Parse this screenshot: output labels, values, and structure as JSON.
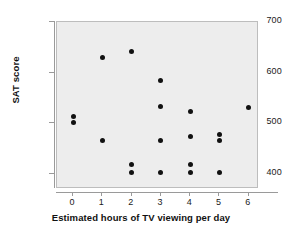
{
  "chart_data": {
    "type": "scatter",
    "title": "",
    "xlabel": "Estimated hours of TV viewing per day",
    "ylabel": "SAT score",
    "xlim": [
      -0.55,
      6.35
    ],
    "ylim": [
      370,
      700
    ],
    "xticks": [
      0,
      1,
      2,
      3,
      4,
      5,
      6
    ],
    "xtick_labels": [
      "0",
      "1",
      "2",
      "3",
      "4",
      "5",
      "6"
    ],
    "yticks": [
      400,
      500,
      600,
      700
    ],
    "ytick_labels": [
      "400",
      "500",
      "600",
      "700"
    ],
    "grid": false,
    "legend": null,
    "marker": "filled-circle",
    "marker_color": "#111111",
    "plot_background": "#ededed",
    "frame_color": "#bdbdbd",
    "axis_color": "#9a9a9a",
    "points": [
      {
        "x": 0,
        "y": 513
      },
      {
        "x": 0,
        "y": 501
      },
      {
        "x": 1,
        "y": 629
      },
      {
        "x": 1,
        "y": 465
      },
      {
        "x": 2,
        "y": 641
      },
      {
        "x": 2,
        "y": 418
      },
      {
        "x": 2,
        "y": 403
      },
      {
        "x": 3,
        "y": 584
      },
      {
        "x": 3,
        "y": 534
      },
      {
        "x": 3,
        "y": 465
      },
      {
        "x": 3,
        "y": 403
      },
      {
        "x": 4,
        "y": 524
      },
      {
        "x": 4,
        "y": 473
      },
      {
        "x": 4,
        "y": 418
      },
      {
        "x": 4,
        "y": 403
      },
      {
        "x": 5,
        "y": 477
      },
      {
        "x": 5,
        "y": 465
      },
      {
        "x": 5,
        "y": 402
      },
      {
        "x": 6,
        "y": 531
      }
    ]
  }
}
